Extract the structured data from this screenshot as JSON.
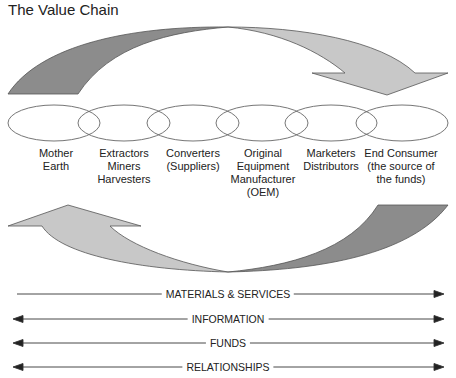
{
  "title": "The Value Chain",
  "stages": [
    {
      "label": "Mother\nEarth",
      "lines": [
        "Mother",
        "Earth"
      ]
    },
    {
      "label": "Extractors Miners Harvesters",
      "lines": [
        "Extractors",
        "Miners",
        "Harvesters"
      ]
    },
    {
      "label": "Converters (Suppliers)",
      "lines": [
        "Converters",
        "(Suppliers)"
      ]
    },
    {
      "label": "Original Equipment Manufacturer (OEM)",
      "lines": [
        "Original",
        "Equipment",
        "Manufacturer",
        "(OEM)"
      ]
    },
    {
      "label": "Marketers Distributors",
      "lines": [
        "Marketers",
        "Distributors"
      ]
    },
    {
      "label": "End Consumer (the source of the funds)",
      "lines": [
        "End Consumer",
        "(the source of",
        "the funds)"
      ]
    }
  ],
  "flows": [
    {
      "label": "MATERIALS & SERVICES",
      "direction": "right"
    },
    {
      "label": "INFORMATION",
      "direction": "both"
    },
    {
      "label": "FUNDS",
      "direction": "both"
    },
    {
      "label": "RELATIONSHIPS",
      "direction": "both"
    }
  ],
  "colors": {
    "dark_arrow": "#8c8c8c",
    "light_arrow": "#c8c8c8",
    "outline": "#555555",
    "ellipse_stroke": "#666666"
  }
}
